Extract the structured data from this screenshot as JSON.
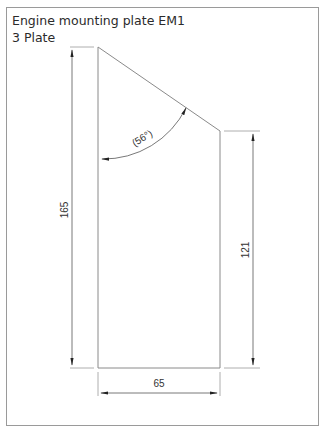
{
  "title": {
    "line1": "Engine mounting plate EM1",
    "line2": "3 Plate"
  },
  "drawing": {
    "line_color": "#888888",
    "dim_color": "#444444",
    "dimensions": {
      "overall_height": "165",
      "right_height": "121",
      "width": "65",
      "angle": "(56°)"
    }
  }
}
